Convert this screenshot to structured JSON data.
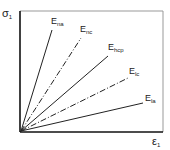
{
  "axes": {
    "y_label": "σ",
    "y_sub": "1",
    "x_label": "ε",
    "x_sub": "1"
  },
  "lines": [
    {
      "name": "E",
      "sub": "na",
      "style": "solid"
    },
    {
      "name": "E",
      "sub": "nc",
      "style": "dash-dot"
    },
    {
      "name": "E",
      "sub": "hcp",
      "style": "solid"
    },
    {
      "name": "E",
      "sub": "lc",
      "style": "dash-dot"
    },
    {
      "name": "E",
      "sub": "la",
      "style": "solid"
    }
  ],
  "colors": {
    "line": "#222222",
    "frame": "#888888"
  }
}
